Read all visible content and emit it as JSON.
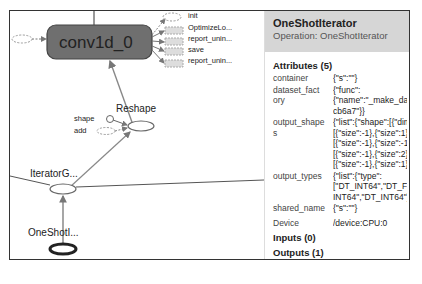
{
  "graph": {
    "nodes": {
      "main": "conv1d_0",
      "reshape": "Reshape",
      "iterator_get_next": "IteratorG...",
      "one_shot": "OneShotI..."
    },
    "aux_nodes": [
      "init",
      "OptimizeLo...",
      "report_unin...",
      "save",
      "report_unin..."
    ],
    "inputs": {
      "shape": "shape",
      "add": "add"
    }
  },
  "panel": {
    "title": "OneShotIterator",
    "subtitle": "Operation: OneShotIterator",
    "attributes_header": "Attributes (5)",
    "attributes": [
      {
        "key": "container",
        "value": "{\"s\":\"\"}"
      },
      {
        "key": "dataset_fact\nory",
        "value": "{\"func\":\n{\"name\":\"_make_datas\ncb6a7\"}}"
      },
      {
        "key": "output_shape\ns",
        "value": "{\"list\":{\"shape\":[{\"dim\":\n[{\"size\":-1},{\"size\":1}]},{\n[{\"size\":-1},{\"size\":-1}]},\n[{\"size\":-1},{\"size\":2}]},{\n[{\"size\":-1},{\"size\":1}]}]}"
      },
      {
        "key": "output_types",
        "value": "{\"list\":{\"type\":\n[\"DT_INT64\",\"DT_FLOA\nINT64\",\"DT_INT64\"]}}"
      },
      {
        "key": "shared_name",
        "value": "{\"s\":\"\"}"
      }
    ],
    "device_label": "Device",
    "device_value": "/device:CPU:0",
    "inputs_header": "Inputs (0)",
    "outputs_header": "Outputs (1)",
    "outputs": [
      "IteratorGetNext"
    ]
  }
}
